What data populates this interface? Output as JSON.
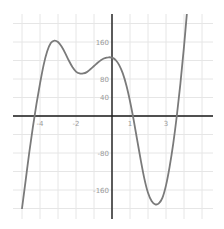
{
  "chart_data": {
    "type": "line",
    "title": "",
    "xlabel": "",
    "ylabel": "",
    "xlim": [
      -5.5,
      5.6
    ],
    "ylim": [
      -225,
      220
    ],
    "grid": true,
    "x_tick_labels": [
      {
        "value": -4,
        "label": "-4"
      },
      {
        "value": -2,
        "label": "-2"
      },
      {
        "value": 1,
        "label": "1"
      },
      {
        "value": 3,
        "label": "3"
      }
    ],
    "y_tick_labels": [
      {
        "value": 160,
        "label": "160"
      },
      {
        "value": 80,
        "label": "80"
      },
      {
        "value": 40,
        "label": "40"
      },
      {
        "value": -80,
        "label": "-80"
      },
      {
        "value": -160,
        "label": "-160"
      }
    ],
    "x_grid_step": 1,
    "y_grid_step": 40,
    "series": [
      {
        "name": "f(x)",
        "color": "#7a7a7a",
        "x": [
          -5.0,
          -4.8,
          -4.6,
          -4.4,
          -4.2,
          -4.0,
          -3.8,
          -3.6,
          -3.4,
          -3.2,
          -3.0,
          -2.8,
          -2.6,
          -2.4,
          -2.2,
          -2.0,
          -1.8,
          -1.6,
          -1.4,
          -1.2,
          -1.0,
          -0.8,
          -0.6,
          -0.4,
          -0.2,
          0.0,
          0.2,
          0.4,
          0.6,
          0.8,
          1.0,
          1.2,
          1.4,
          1.6,
          1.8,
          2.0,
          2.2,
          2.4,
          2.6,
          2.8,
          3.0,
          3.2,
          3.4,
          3.6,
          3.8,
          4.0,
          4.2
        ],
        "values": [
          -200,
          -140,
          -80,
          -25,
          25,
          70,
          110,
          140,
          158,
          163,
          160,
          150,
          136,
          120,
          106,
          96,
          92,
          92,
          95,
          101,
          108,
          115,
          121,
          125,
          127,
          126,
          121,
          110,
          92,
          66,
          32,
          -8,
          -52,
          -96,
          -136,
          -166,
          -184,
          -191,
          -189,
          -177,
          -150,
          -110,
          -60,
          0,
          70,
          150,
          240
        ]
      }
    ]
  },
  "axes": {
    "origin_px": {
      "x": 112,
      "y": 116
    },
    "x_unit_px": 18,
    "y_unit_px_per_value": 0.4625,
    "plot_bounds_px": {
      "left": 13,
      "right": 213,
      "top": 14,
      "bottom": 219
    }
  }
}
